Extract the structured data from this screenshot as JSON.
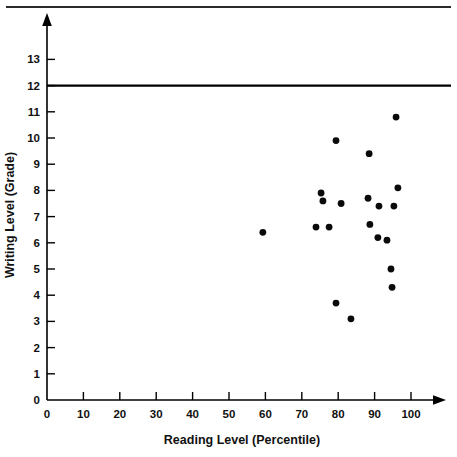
{
  "chart_data": {
    "type": "scatter",
    "title": "",
    "xlabel": "Reading Level (Percentile)",
    "ylabel": "Writing Level (Grade)",
    "xlim": [
      0,
      112
    ],
    "ylim": [
      0,
      13.6
    ],
    "grid": false,
    "legend": null,
    "x_ticks": [
      0,
      10,
      20,
      30,
      40,
      50,
      60,
      70,
      80,
      90,
      100
    ],
    "x_tick_labels": [
      "0",
      "10",
      "20",
      "30",
      "40",
      "50",
      "60",
      "70",
      "80",
      "90",
      "100"
    ],
    "y_ticks": [
      0,
      1,
      2,
      3,
      4,
      5,
      6,
      7,
      8,
      9,
      10,
      11,
      12,
      13
    ],
    "y_tick_labels": [
      "0",
      "1",
      "2",
      "3",
      "4",
      "5",
      "6",
      "7",
      "8",
      "9",
      "10",
      "11",
      "12",
      "13"
    ],
    "annotations": [
      {
        "kind": "horizontal-reference-line",
        "y": 12,
        "label": ""
      }
    ],
    "points": [
      {
        "x": 59.3,
        "y": 6.4
      },
      {
        "x": 73.9,
        "y": 6.6
      },
      {
        "x": 75.3,
        "y": 7.9
      },
      {
        "x": 75.8,
        "y": 7.6
      },
      {
        "x": 77.5,
        "y": 6.6
      },
      {
        "x": 79.4,
        "y": 9.9
      },
      {
        "x": 79.4,
        "y": 3.7
      },
      {
        "x": 80.8,
        "y": 7.5
      },
      {
        "x": 83.5,
        "y": 3.1
      },
      {
        "x": 88.2,
        "y": 7.7
      },
      {
        "x": 88.5,
        "y": 9.4
      },
      {
        "x": 88.7,
        "y": 6.7
      },
      {
        "x": 90.9,
        "y": 6.2
      },
      {
        "x": 91.2,
        "y": 7.4
      },
      {
        "x": 93.4,
        "y": 6.1
      },
      {
        "x": 94.5,
        "y": 5.0
      },
      {
        "x": 94.8,
        "y": 4.3
      },
      {
        "x": 95.3,
        "y": 7.4
      },
      {
        "x": 95.9,
        "y": 10.8
      },
      {
        "x": 96.4,
        "y": 8.1
      }
    ],
    "colors": {
      "marker": "#0a0a0a",
      "axis": "#000000",
      "background": "#ffffff",
      "reference_line": "#000000"
    }
  }
}
